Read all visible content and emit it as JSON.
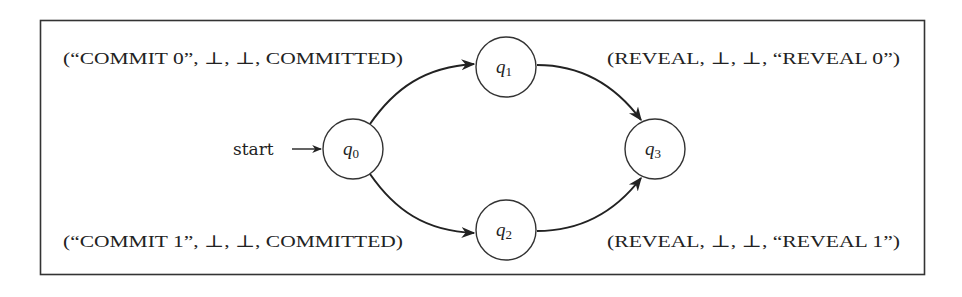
{
  "diagram": {
    "type": "finite-state-automaton",
    "start_label": "start",
    "states": [
      {
        "id": "q0",
        "name": "q",
        "sub": "0"
      },
      {
        "id": "q1",
        "name": "q",
        "sub": "1"
      },
      {
        "id": "q2",
        "name": "q",
        "sub": "2"
      },
      {
        "id": "q3",
        "name": "q",
        "sub": "3"
      }
    ],
    "transitions": [
      {
        "from": "q0",
        "to": "q1",
        "label": "(“COMMIT 0”, ⊥, ⊥, COMMITTED)"
      },
      {
        "from": "q0",
        "to": "q2",
        "label": "(“COMMIT 1”, ⊥, ⊥, COMMITTED)"
      },
      {
        "from": "q1",
        "to": "q3",
        "label": "(REVEAL, ⊥, ⊥, “REVEAL 0”)"
      },
      {
        "from": "q2",
        "to": "q3",
        "label": "(REVEAL, ⊥, ⊥, “REVEAL 1”)"
      }
    ],
    "labels": {
      "commit0": "(“COMMIT 0”, ⊥, ⊥, COMMITTED)",
      "commit1": "(“COMMIT 1”, ⊥, ⊥, COMMITTED)",
      "reveal0": "(REVEAL, ⊥, ⊥, “REVEAL 0”)",
      "reveal1": "(REVEAL, ⊥, ⊥, “REVEAL 1”)"
    }
  }
}
